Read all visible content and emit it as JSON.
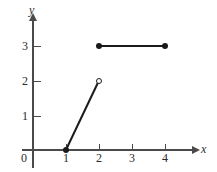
{
  "chart_data": {
    "type": "line",
    "title": "",
    "xlabel": "x",
    "ylabel": "y",
    "xlim": [
      0,
      4.6
    ],
    "ylim": [
      0,
      3.6
    ],
    "grid": false,
    "legend": "none",
    "x_ticks": [
      {
        "value": 1,
        "label": "1"
      },
      {
        "value": 2,
        "label": "2"
      },
      {
        "value": 3,
        "label": "3"
      },
      {
        "value": 4,
        "label": "4"
      }
    ],
    "y_ticks": [
      {
        "value": 1,
        "label": "1"
      },
      {
        "value": 2,
        "label": "2"
      },
      {
        "value": 3,
        "label": "3"
      }
    ],
    "origin_label": "0",
    "series": [
      {
        "name": "rising-segment",
        "from": {
          "x": 1,
          "y": 0
        },
        "to": {
          "x": 2,
          "y": 2
        },
        "start_endpoint": "closed",
        "end_endpoint": "open"
      },
      {
        "name": "constant-segment",
        "from": {
          "x": 2,
          "y": 3
        },
        "to": {
          "x": 4,
          "y": 3
        },
        "start_endpoint": "closed",
        "end_endpoint": "closed"
      }
    ],
    "colors": {
      "axis": "#4a4a4a",
      "curve": "#1a1a1a",
      "text": "#2b2b2b",
      "background": "#ffffff"
    }
  }
}
